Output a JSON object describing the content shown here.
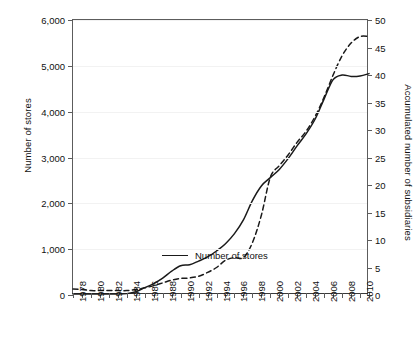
{
  "chart_data": {
    "type": "line",
    "title": "",
    "xlabel": "",
    "ylabel": "Number of stores",
    "y2label": "Accumulated number of subsidiaries",
    "grid": true,
    "legend_position": "bottom-right",
    "xlim": [
      1978,
      2011
    ],
    "ylim": [
      0,
      6000
    ],
    "y2lim": [
      0,
      50
    ],
    "x": [
      1978,
      1979,
      1980,
      1981,
      1982,
      1983,
      1984,
      1985,
      1986,
      1987,
      1988,
      1989,
      1990,
      1991,
      1992,
      1993,
      1994,
      1995,
      1996,
      1997,
      1998,
      1999,
      2000,
      2001,
      2002,
      2003,
      2004,
      2005,
      2006,
      2007,
      2008,
      2009,
      2010,
      2011
    ],
    "xticks": [
      1978,
      1980,
      1982,
      1984,
      1986,
      1988,
      1990,
      1992,
      1994,
      1996,
      1998,
      2000,
      2002,
      2004,
      2006,
      2008,
      2010
    ],
    "xticklabels": [
      "1978",
      "1980",
      "1982",
      "1984",
      "1986",
      "1988",
      "1990",
      "1992",
      "1994",
      "1996",
      "1998",
      "2000",
      "2002",
      "2004",
      "2006",
      "2008",
      "2010"
    ],
    "yticks": [
      0,
      1000,
      2000,
      3000,
      4000,
      5000,
      6000
    ],
    "yticklabels": [
      "0",
      "1,000",
      "2,000",
      "3,000",
      "4,000",
      "5,000",
      "6,000"
    ],
    "y2ticks": [
      0,
      5,
      10,
      15,
      20,
      25,
      30,
      35,
      40,
      45,
      50
    ],
    "y2ticklabels": [
      "0",
      "5",
      "10",
      "15",
      "20",
      "25",
      "30",
      "35",
      "40",
      "45",
      "50"
    ],
    "series": [
      {
        "name": "Number of stores",
        "axis": "left",
        "style": "solid",
        "color": "#1a1a1a",
        "values": [
          20,
          20,
          20,
          20,
          20,
          20,
          30,
          70,
          160,
          250,
          370,
          520,
          640,
          660,
          740,
          830,
          960,
          1120,
          1340,
          1640,
          2060,
          2380,
          2560,
          2740,
          2980,
          3260,
          3520,
          3840,
          4280,
          4700,
          4800,
          4770,
          4780,
          4830
        ]
      },
      {
        "name": "Accumulated number of subsidiaries",
        "axis": "right",
        "style": "dashed",
        "color": "#1a1a1a",
        "values": [
          1.1,
          1.0,
          0.8,
          0.8,
          0.8,
          0.8,
          0.8,
          1.0,
          1.3,
          1.7,
          2.2,
          2.7,
          3.0,
          3.1,
          3.4,
          4.1,
          5.0,
          6.3,
          6.8,
          6.8,
          9.5,
          14.5,
          21.4,
          23.5,
          25.5,
          27.8,
          29.8,
          32.5,
          36.0,
          40.0,
          43.5,
          45.8,
          47.0,
          47.0
        ]
      }
    ]
  },
  "legend": {
    "entries": [
      {
        "label": "Number of stores",
        "style": "solid"
      }
    ]
  }
}
